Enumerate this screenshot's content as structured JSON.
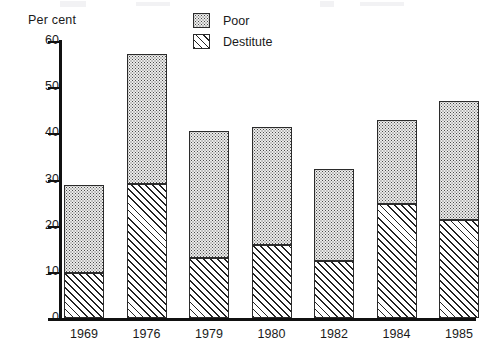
{
  "chart_data": {
    "type": "bar",
    "subtype": "stacked-vertical",
    "title": "",
    "xlabel": "",
    "ylabel": "Per cent",
    "ylim": [
      0,
      60
    ],
    "yticks": [
      0,
      10,
      20,
      30,
      40,
      50,
      60
    ],
    "grid": false,
    "legend_position": "top-right",
    "categories": [
      "1969",
      "1976",
      "1979",
      "1980",
      "1982",
      "1984",
      "1985"
    ],
    "series": [
      {
        "name": "Destitute",
        "pattern": "diagonal-hatch",
        "values": [
          9.7,
          29.0,
          13.0,
          15.8,
          12.3,
          24.7,
          21.2
        ]
      },
      {
        "name": "Poor",
        "pattern": "stipple-dots",
        "values": [
          19.1,
          28.2,
          27.5,
          25.5,
          20.0,
          18.1,
          25.8
        ]
      }
    ],
    "totals": [
      28.8,
      57.2,
      40.5,
      41.3,
      32.3,
      42.8,
      47.0
    ]
  },
  "axes": {
    "y_title": "Per cent",
    "y_tick_labels": [
      "60",
      "50",
      "40",
      "30",
      "20",
      "10",
      "0"
    ],
    "x_tick_labels": [
      "1969",
      "1976",
      "1979",
      "1980",
      "1982",
      "1984",
      "1985"
    ]
  },
  "legend": {
    "items": [
      {
        "label": "Poor",
        "swatch": "stipple-swatch"
      },
      {
        "label": "Destitute",
        "swatch": "hatch-swatch"
      }
    ]
  },
  "colors": {
    "ink": "#1a1a1a",
    "axis": "#111111",
    "poor_fill": "#ececeb",
    "destitute_fill": "#ffffff",
    "background": "#ffffff"
  }
}
